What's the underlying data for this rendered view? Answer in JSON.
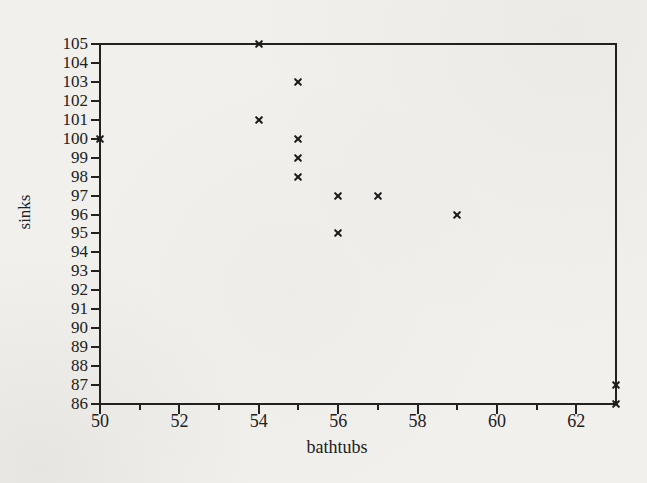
{
  "figure": {
    "background_color": "#f1f0ed",
    "ink_color": "#222120"
  },
  "chart_data": {
    "type": "scatter",
    "title": "",
    "xlabel": "bathtubs",
    "ylabel": "sinks",
    "marker": "x",
    "grid": false,
    "frame": true,
    "xlim": [
      50,
      63
    ],
    "ylim": [
      86,
      105
    ],
    "x_major_ticks": [
      50,
      52,
      54,
      56,
      58,
      60,
      62
    ],
    "x_minor_ticks": [
      51,
      53,
      55,
      57,
      59,
      61
    ],
    "y_ticks": [
      105,
      104,
      103,
      102,
      101,
      100,
      99,
      98,
      97,
      96,
      95,
      94,
      93,
      92,
      91,
      90,
      89,
      88,
      87,
      86
    ],
    "points": [
      [
        50,
        100
      ],
      [
        54,
        105
      ],
      [
        54,
        101
      ],
      [
        55,
        103
      ],
      [
        55,
        100
      ],
      [
        55,
        99
      ],
      [
        55,
        98
      ],
      [
        56,
        97
      ],
      [
        56,
        95
      ],
      [
        57,
        97
      ],
      [
        59,
        96
      ],
      [
        63,
        87
      ],
      [
        63,
        86
      ]
    ]
  }
}
